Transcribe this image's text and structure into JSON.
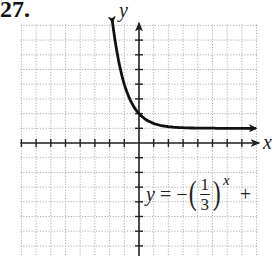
{
  "problem": {
    "number": "27."
  },
  "equation": {
    "lhs": "y",
    "equals": "=",
    "sign": "−",
    "open_paren": "(",
    "numerator": "1",
    "denominator": "3",
    "close_paren": ")",
    "exponent": "x",
    "trailing": "+"
  },
  "axes": {
    "x_label": "x",
    "y_label": "y"
  },
  "chart_data": {
    "type": "line",
    "title": "",
    "xlabel": "x",
    "ylabel": "y",
    "xlim": [
      -8,
      8
    ],
    "ylim": [
      -7.7,
      8
    ],
    "grid": true,
    "tick_spacing": 1,
    "pixel_origin": [
      139,
      143
    ],
    "pixel_per_unit": 14.7,
    "series": [
      {
        "name": "y = -(1/3)^x + ...",
        "function": "(1/3)^x + 1 (as drawn)",
        "asymptote_y": 1,
        "y_intercept": 2,
        "x": [
          -1.8,
          -1.5,
          -1,
          -0.5,
          0,
          0.5,
          1,
          1.5,
          2,
          3,
          4,
          5,
          6,
          7,
          7.9
        ],
        "values": [
          8.23,
          6.2,
          4,
          2.73,
          2,
          1.58,
          1.33,
          1.19,
          1.11,
          1.04,
          1.01,
          1.0,
          1.0,
          1.0,
          1.0
        ],
        "arrows": "both ends"
      }
    ],
    "annotations": [
      "y = −(1/3)^x +"
    ]
  }
}
